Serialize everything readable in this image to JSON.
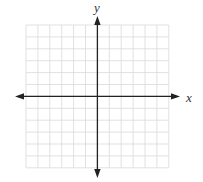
{
  "diagram": {
    "type": "cartesian-coordinate-grid",
    "x_axis_label": "x",
    "y_axis_label": "y",
    "grid": {
      "columns": 12,
      "rows": 12,
      "left_px": 26,
      "top_px": 25,
      "cell_px": 11.9,
      "line_color": "#d9d9d9",
      "line_width": 0.8
    },
    "axes": {
      "origin_px": [
        97.4,
        96.4
      ],
      "x_arrow_left_px": 15,
      "x_arrow_right_px": 180,
      "y_arrow_top_px": 16,
      "y_arrow_bottom_px": 178,
      "color": "#222222",
      "width": 1.3
    }
  }
}
